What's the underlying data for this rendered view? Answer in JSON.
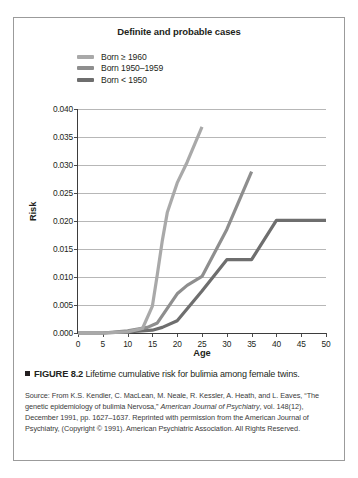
{
  "figure": {
    "marker": "black-square",
    "number": "FIGURE 8.2",
    "caption_text": "Lifetime cumulative risk for bulimia among female twins."
  },
  "source": {
    "line1": "Source: From K.S. Kendler, C. MacLean, M. Neale, R. Kessler, A. Heath,",
    "line2_pre": "and L. Eaves, “The genetic epidemiology of bulimia Nervosa,” ",
    "journal_part1": "American Journal",
    "journal_part2": "of Psychiatry",
    "line3_post": ", vol. 148(12), December 1991, pp. 1627–1637. Reprinted with",
    "line4": "permission from the American Journal of Psychiatry, (Copyright © 1991).",
    "line5": "American Psychiatric Association. All Rights Reserved."
  },
  "chart_data": {
    "type": "line",
    "title": "Definite and probable cases",
    "xlabel": "Age",
    "ylabel": "Risk",
    "xlim": [
      0,
      50
    ],
    "ylim": [
      0.0,
      0.04
    ],
    "xticks": [
      "0",
      "5",
      "10",
      "15",
      "20",
      "25",
      "30",
      "35",
      "40",
      "45",
      "50"
    ],
    "xtick_values": [
      0,
      5,
      10,
      15,
      20,
      25,
      30,
      35,
      40,
      45,
      50
    ],
    "yticks": [
      "0.000",
      "0.005",
      "0.010",
      "0.015",
      "0.020",
      "0.025",
      "0.030",
      "0.035",
      "0.040"
    ],
    "ytick_values": [
      0.0,
      0.005,
      0.01,
      0.015,
      0.02,
      0.025,
      0.03,
      0.035,
      0.04
    ],
    "grid": "horizontal",
    "legend_position": "top-left",
    "series": [
      {
        "name": "Born ≥ 1960",
        "color": "#a9a9a9",
        "x": [
          0,
          5,
          10,
          13,
          15,
          16,
          17,
          18,
          20,
          22,
          25
        ],
        "values": [
          0.0,
          0.0,
          0.0002,
          0.0008,
          0.0048,
          0.0105,
          0.0165,
          0.0215,
          0.0268,
          0.0305,
          0.0368
        ]
      },
      {
        "name": "Born 1950–1959",
        "color": "#8e8e8e",
        "x": [
          0,
          5,
          10,
          14,
          16,
          18,
          20,
          22,
          25,
          30,
          35
        ],
        "values": [
          0.0,
          0.0,
          0.0004,
          0.001,
          0.0018,
          0.0044,
          0.007,
          0.0085,
          0.0101,
          0.0185,
          0.0288
        ]
      },
      {
        "name": "Born < 1950",
        "color": "#6e6e6e",
        "x": [
          0,
          5,
          10,
          15,
          17,
          20,
          25,
          30,
          35,
          40,
          45,
          50
        ],
        "values": [
          0.0,
          0.0,
          0.0002,
          0.0005,
          0.001,
          0.0022,
          0.0075,
          0.0131,
          0.0131,
          0.0201,
          0.0201,
          0.0201
        ]
      }
    ]
  }
}
